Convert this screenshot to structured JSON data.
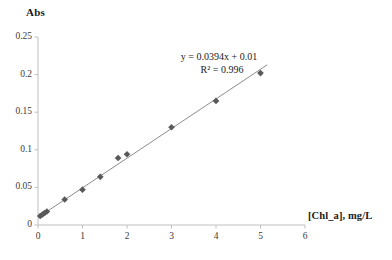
{
  "chart_data": {
    "type": "scatter",
    "title": "",
    "xlabel": "[Chl_a], mg/L",
    "ylabel": "Abs",
    "xlim": [
      0,
      6
    ],
    "ylim": [
      0,
      0.25
    ],
    "grid": false,
    "legend": "none",
    "x_ticks": [
      "0",
      "1",
      "2",
      "3",
      "4",
      "5",
      "6"
    ],
    "x_tick_values": [
      0,
      1,
      2,
      3,
      4,
      5,
      6
    ],
    "y_ticks": [
      "0",
      "0.05",
      "0.1",
      "0.15",
      "0.2",
      "0.25"
    ],
    "y_tick_values": [
      0,
      0.05,
      0.1,
      0.15,
      0.2,
      0.25
    ],
    "series": [
      {
        "name": "calibration points",
        "marker": "diamond",
        "color": "#595959",
        "x": [
          0.05,
          0.1,
          0.15,
          0.2,
          0.6,
          1.0,
          1.4,
          1.8,
          2.0,
          3.0,
          4.0,
          5.0
        ],
        "values": [
          0.012,
          0.014,
          0.016,
          0.018,
          0.034,
          0.047,
          0.064,
          0.089,
          0.094,
          0.13,
          0.165,
          0.202
        ]
      },
      {
        "name": "linear trendline",
        "marker": "none",
        "color": "#7f7f7f",
        "x": [
          0.0,
          5.15
        ],
        "values": [
          0.01,
          0.213
        ]
      }
    ],
    "annotations": {
      "equation": "y = 0.0394x  + 0.01",
      "r_squared": "R² = 0.996",
      "slope": 0.0394,
      "intercept": 0.01,
      "r2_value": 0.996
    }
  },
  "axes": {
    "y_title": "Abs",
    "x_title": "[Chl_a], mg/L"
  },
  "colors": {
    "marker": "#595959",
    "trendline": "#808080",
    "axis": "#bfbfbf",
    "text": "#1a1a1a"
  }
}
